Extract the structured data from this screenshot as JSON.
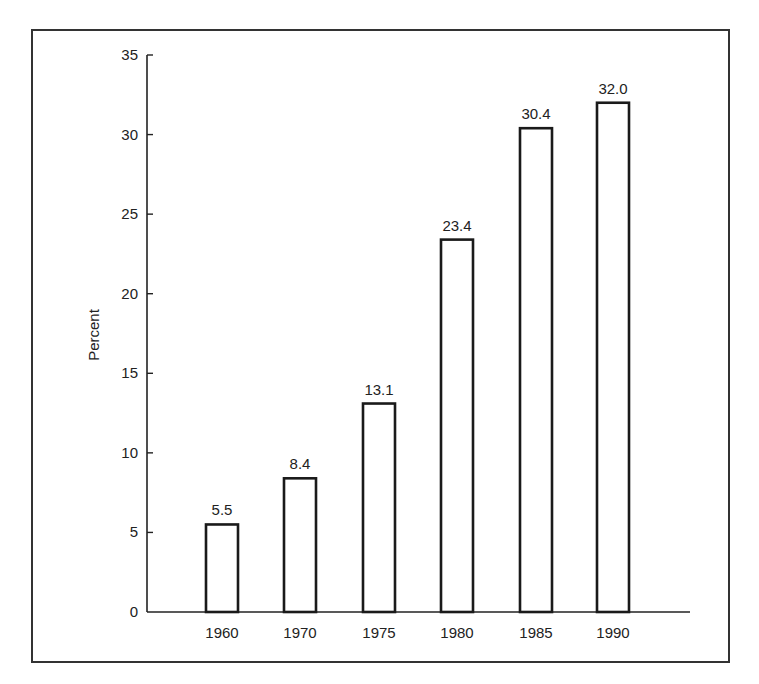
{
  "chart_data": {
    "type": "bar",
    "title": "",
    "xlabel": "",
    "ylabel": "Percent",
    "categories": [
      "1960",
      "1970",
      "1975",
      "1980",
      "1985",
      "1990"
    ],
    "values": [
      5.5,
      8.4,
      13.1,
      23.4,
      30.4,
      32.0
    ],
    "value_labels": [
      "5.5",
      "8.4",
      "13.1",
      "23.4",
      "30.4",
      "32.0"
    ],
    "ylim": [
      0,
      35
    ],
    "yticks": [
      0,
      5,
      10,
      15,
      20,
      25,
      30,
      35
    ],
    "grid": false,
    "legend": null,
    "bar_fill": "#ffffff",
    "bar_stroke": "#1a1a1a"
  }
}
